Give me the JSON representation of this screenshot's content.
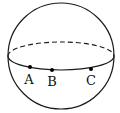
{
  "diagram": {
    "type": "sphere-with-equator",
    "sphere": {
      "cx": 61,
      "cy": 56,
      "r": 53
    },
    "equator": {
      "cx": 61,
      "cy": 56,
      "rx": 53,
      "ry": 14,
      "back_half": "dashed",
      "front_half": "solid"
    },
    "points": [
      {
        "label": "A",
        "x": 30,
        "y": 67,
        "lx": 29,
        "ly": 84
      },
      {
        "label": "B",
        "x": 52,
        "y": 70,
        "lx": 52,
        "ly": 86
      },
      {
        "label": "C",
        "x": 91,
        "y": 69,
        "lx": 91,
        "ly": 85
      }
    ],
    "stroke_color": "#1a1a1a"
  }
}
